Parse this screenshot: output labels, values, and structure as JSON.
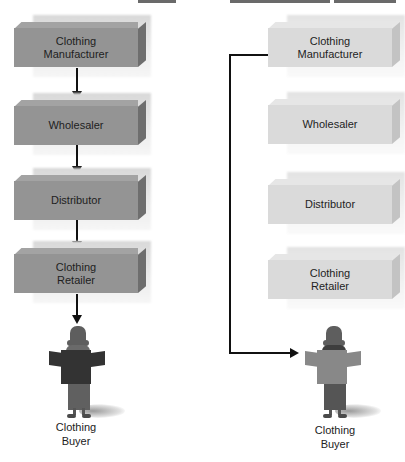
{
  "diagram": {
    "left_channel": {
      "description": "Traditional channel",
      "boxes": [
        {
          "label_line1": "Clothing",
          "label_line2": "Manufacturer"
        },
        {
          "label_line1": "Wholesaler",
          "label_line2": ""
        },
        {
          "label_line1": "Distributor",
          "label_line2": ""
        },
        {
          "label_line1": "Clothing",
          "label_line2": "Retailer"
        }
      ],
      "buyer": {
        "label_line1": "Clothing",
        "label_line2": "Buyer"
      },
      "shirt_color": "#333333",
      "box_color": "#949494"
    },
    "right_channel": {
      "description": "Disintermediated channel",
      "boxes": [
        {
          "label_line1": "Clothing",
          "label_line2": "Manufacturer"
        },
        {
          "label_line1": "Wholesaler",
          "label_line2": ""
        },
        {
          "label_line1": "Distributor",
          "label_line2": ""
        },
        {
          "label_line1": "Clothing",
          "label_line2": "Retailer"
        }
      ],
      "buyer": {
        "label_line1": "Clothing",
        "label_line2": "Buyer"
      },
      "shirt_color": "#888888",
      "box_color": "#dadada"
    },
    "arrow_color": "#111111"
  }
}
